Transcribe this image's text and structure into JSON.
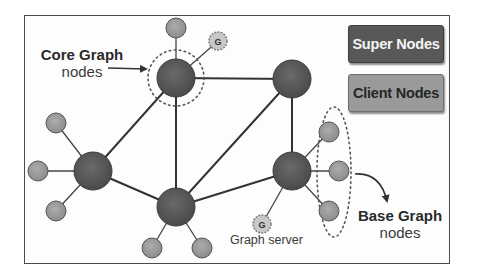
{
  "diagram": {
    "type": "network-topology",
    "legend": {
      "super_nodes": {
        "label": "Super Nodes",
        "color": "#585858"
      },
      "client_nodes": {
        "label": "Client Nodes",
        "color": "#9a9a9a"
      }
    },
    "annotations": {
      "core_graph": {
        "title": "Core Graph",
        "subtitle": "nodes"
      },
      "base_graph": {
        "title": "Base Graph",
        "subtitle": "nodes"
      },
      "graph_server": {
        "label": "Graph server"
      }
    },
    "g_node_glyph": "G",
    "colors": {
      "super_node": "#5a5a5a",
      "client_node": "#9c9c9c",
      "g_node": "#c8c8c8",
      "edge": "#333333",
      "frame": "#4a4a4a"
    },
    "super_nodes": [
      {
        "id": "A",
        "x": 176,
        "y": 78
      },
      {
        "id": "B",
        "x": 292,
        "y": 79
      },
      {
        "id": "C",
        "x": 93,
        "y": 171
      },
      {
        "id": "D",
        "x": 176,
        "y": 207
      },
      {
        "id": "E",
        "x": 292,
        "y": 171
      }
    ],
    "client_nodes": [
      {
        "id": "a1",
        "parent": "A",
        "x": 176,
        "y": 28
      },
      {
        "id": "c1",
        "parent": "C",
        "x": 56,
        "y": 123
      },
      {
        "id": "c2",
        "parent": "C",
        "x": 38,
        "y": 171
      },
      {
        "id": "c3",
        "parent": "C",
        "x": 56,
        "y": 211
      },
      {
        "id": "d1",
        "parent": "D",
        "x": 152,
        "y": 248
      },
      {
        "id": "d2",
        "parent": "D",
        "x": 202,
        "y": 248
      },
      {
        "id": "e1",
        "parent": "E",
        "x": 329,
        "y": 132
      },
      {
        "id": "e2",
        "parent": "E",
        "x": 339,
        "y": 171
      },
      {
        "id": "e3",
        "parent": "E",
        "x": 329,
        "y": 211
      }
    ],
    "graph_servers": [
      {
        "id": "g1",
        "parent": "A",
        "x": 218,
        "y": 41
      },
      {
        "id": "g2",
        "parent": "E",
        "x": 262,
        "y": 224
      }
    ],
    "edges": [
      [
        "A",
        "B"
      ],
      [
        "A",
        "C"
      ],
      [
        "A",
        "D"
      ],
      [
        "B",
        "D"
      ],
      [
        "B",
        "E"
      ],
      [
        "C",
        "D"
      ],
      [
        "D",
        "E"
      ]
    ]
  }
}
